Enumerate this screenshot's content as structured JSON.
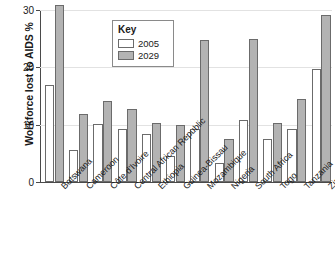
{
  "chart_data": {
    "type": "bar",
    "title": "",
    "xlabel": "",
    "ylabel": "Workforce lost to AIDS %",
    "ylim": [
      0,
      30
    ],
    "yticks": [
      0,
      10,
      20,
      30
    ],
    "ytick_labels": [
      "0",
      "10",
      "20",
      "30"
    ],
    "grid": true,
    "legend_position": "inside-top-left",
    "legend_title": "Key",
    "categories": [
      "Botswana",
      "Cameroon",
      "Côte d'Ivoire",
      "Central African Republic",
      "Ethiopia",
      "Guinea-Bissau",
      "Mozambique",
      "Nigeria",
      "South Africa",
      "Togo",
      "Tanzania",
      "Zimbabwe"
    ],
    "series": [
      {
        "name": "2005",
        "color": "#ffffff",
        "values": [
          16.9,
          5.5,
          10.1,
          9.2,
          8.4,
          4.6,
          9.3,
          3.3,
          10.8,
          7.5,
          9.2,
          19.7
        ]
      },
      {
        "name": "2029",
        "color": "#b3b3b3",
        "values": [
          30.8,
          11.9,
          14.2,
          12.8,
          10.3,
          10.0,
          24.8,
          7.5,
          25.0,
          10.3,
          14.5,
          29.2
        ]
      }
    ]
  },
  "axes": {
    "y_title": "Workforce lost to AIDS %"
  },
  "legend": {
    "title": "Key",
    "entries": [
      {
        "label": "2005"
      },
      {
        "label": "2029"
      }
    ]
  },
  "caption": {
    "text": ""
  }
}
